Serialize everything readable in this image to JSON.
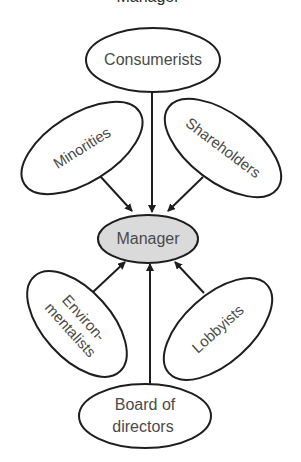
{
  "diagram": {
    "title_partial": "Manager",
    "colors": {
      "stroke": "#1e1e1e",
      "center_fill": "#dadada",
      "node_fill": "#ffffff",
      "text": "#4a4a4a"
    },
    "center": {
      "label": "Manager"
    },
    "nodes": [
      {
        "id": "consumerists",
        "label": "Consumerists"
      },
      {
        "id": "minorities",
        "label": "Minorities"
      },
      {
        "id": "shareholders",
        "label": "Shareholders"
      },
      {
        "id": "environmentalists",
        "label_line1": "Environ-",
        "label_line2": "mentalists"
      },
      {
        "id": "lobbyists",
        "label": "Lobbyists"
      },
      {
        "id": "board-of-directors",
        "label_line1": "Board of",
        "label_line2": "directors"
      }
    ],
    "edges": [
      {
        "from": "consumerists",
        "to": "manager"
      },
      {
        "from": "minorities",
        "to": "manager"
      },
      {
        "from": "shareholders",
        "to": "manager"
      },
      {
        "from": "environmentalists",
        "to": "manager"
      },
      {
        "from": "lobbyists",
        "to": "manager"
      },
      {
        "from": "board-of-directors",
        "to": "manager"
      }
    ]
  }
}
